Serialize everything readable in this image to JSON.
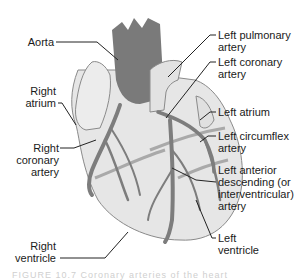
{
  "diagram": {
    "type": "anatomical-illustration",
    "colors": {
      "aorta": "#7a7a7a",
      "heart_body": "#e6e6e6",
      "coronary_vessels": "#7d7d7d",
      "veins_light": "#a9a9a9",
      "outline": "#8a8a8a",
      "leader_lines": "#222222"
    },
    "labels": {
      "left_side": [
        {
          "id": "aorta",
          "text": "Aorta"
        },
        {
          "id": "right_atrium_1",
          "text": "Right"
        },
        {
          "id": "right_atrium_2",
          "text": "atrium"
        },
        {
          "id": "rca_1",
          "text": "Right"
        },
        {
          "id": "rca_2",
          "text": "coronary"
        },
        {
          "id": "rca_3",
          "text": "artery"
        },
        {
          "id": "rv_1",
          "text": "Right"
        },
        {
          "id": "rv_2",
          "text": "ventricle"
        }
      ],
      "right_side": [
        {
          "id": "lpa_1",
          "text": "Left pulmonary"
        },
        {
          "id": "lpa_2",
          "text": "artery"
        },
        {
          "id": "lca_1",
          "text": "Left coronary"
        },
        {
          "id": "lca_2",
          "text": "artery"
        },
        {
          "id": "la_1",
          "text": "Left atrium"
        },
        {
          "id": "lcx_1",
          "text": "Left circumflex"
        },
        {
          "id": "lcx_2",
          "text": "artery"
        },
        {
          "id": "lad_1",
          "text": "Left anterior"
        },
        {
          "id": "lad_2",
          "text": "descending (or"
        },
        {
          "id": "lad_3",
          "text": "interventricular)"
        },
        {
          "id": "lad_4",
          "text": "artery"
        },
        {
          "id": "lv_1",
          "text": "Left"
        },
        {
          "id": "lv_2",
          "text": "ventricle"
        }
      ]
    },
    "caption": "FIGURE 10.7  Coronary arteries of the heart"
  }
}
